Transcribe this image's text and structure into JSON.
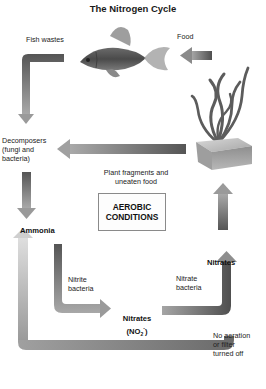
{
  "title": "The Nitrogen Cycle",
  "labels": {
    "fish_wastes": "Fish wastes",
    "food": "Food",
    "decomposers_line1": "Decomposers",
    "decomposers_line2": "(fungi and",
    "decomposers_line3": "bacteria)",
    "plant_fragments_line1": "Plant fragments and",
    "plant_fragments_line2": "uneaten food",
    "ammonia": "Ammonia",
    "nitrite_bacteria_line1": "Nitrite",
    "nitrite_bacteria_line2": "bacteria",
    "nitrates_bottom_line1": "Nitrates",
    "nitrates_bottom_formula_base": "(NO",
    "nitrates_bottom_formula_sub": "2",
    "nitrates_bottom_formula_sup": "-",
    "nitrates_bottom_formula_close": ")",
    "nitrate_bacteria_line1": "Nitrate",
    "nitrate_bacteria_line2": "bacteria",
    "nitrates_top": "Nitrates",
    "no_aeration_line1": "No aeration",
    "no_aeration_line2": "or filter",
    "no_aeration_line3": "turned off"
  },
  "aerobic_box": {
    "line1": "AEROBIC",
    "line2": "CONDITIONS"
  },
  "illustrations": {
    "fish": "goldfish-illustration",
    "plant": "aquatic-plant-illustration"
  },
  "colors": {
    "arrow_dark": "#5a5a5a",
    "arrow_mid": "#8c8c8c",
    "arrow_light": "#c4c4c4",
    "box_border": "#8a8a8a"
  }
}
